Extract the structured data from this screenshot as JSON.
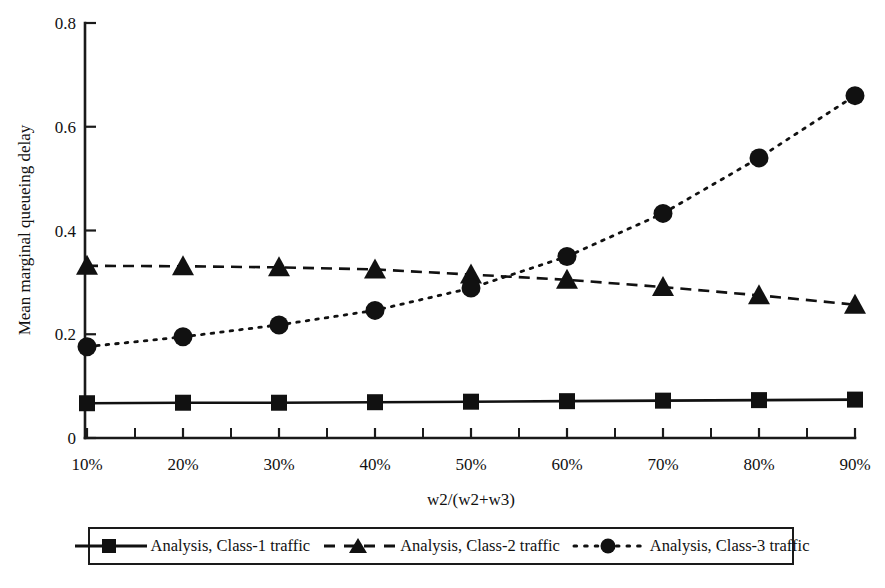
{
  "chart_data": {
    "type": "line",
    "title": "",
    "xlabel": "w2/(w2+w3)",
    "ylabel": "Mean marginal queueing delay",
    "categories": [
      "10%",
      "20%",
      "30%",
      "40%",
      "50%",
      "60%",
      "70%",
      "80%",
      "90%"
    ],
    "x": [
      10,
      20,
      30,
      40,
      50,
      60,
      70,
      80,
      90
    ],
    "xlim": [
      10,
      90
    ],
    "ylim": [
      0,
      0.8
    ],
    "yticks": [
      "0",
      "0.2",
      "0.4",
      "0.6",
      "0.8"
    ],
    "ytick_values": [
      0,
      0.2,
      0.4,
      0.6,
      0.8
    ],
    "grid": false,
    "legend_position": "bottom",
    "series": [
      {
        "name": "Analysis, Class-1 traffic",
        "marker": "square",
        "linestyle": "solid",
        "color": "#111111",
        "values": [
          0.067,
          0.068,
          0.068,
          0.069,
          0.07,
          0.071,
          0.072,
          0.073,
          0.074
        ]
      },
      {
        "name": "Analysis, Class-2 traffic",
        "marker": "triangle",
        "linestyle": "dashed",
        "color": "#111111",
        "values": [
          0.332,
          0.331,
          0.329,
          0.325,
          0.315,
          0.305,
          0.291,
          0.275,
          0.257
        ]
      },
      {
        "name": "Analysis, Class-3 traffic",
        "marker": "circle",
        "linestyle": "dotted",
        "color": "#111111",
        "values": [
          0.176,
          0.195,
          0.218,
          0.246,
          0.289,
          0.35,
          0.433,
          0.54,
          0.66
        ]
      }
    ]
  },
  "legend": {
    "items": [
      {
        "label": "Analysis, Class-1 traffic",
        "marker": "square-marker-icon",
        "linestyle": "solid"
      },
      {
        "label": "Analysis, Class-2 traffic",
        "marker": "triangle-marker-icon",
        "linestyle": "dashed"
      },
      {
        "label": "Analysis, Class-3 traffic",
        "marker": "circle-marker-icon",
        "linestyle": "dotted"
      }
    ]
  },
  "axes": {
    "y_title": "Mean marginal queueing delay",
    "x_title": "w2/(w2+w3)",
    "y_tick_labels": [
      "0.8",
      "0.6",
      "0.4",
      "0.2",
      "0"
    ],
    "x_tick_labels": [
      "10%",
      "20%",
      "30%",
      "40%",
      "50%",
      "60%",
      "70%",
      "80%",
      "90%"
    ]
  },
  "colors": {
    "foreground": "#111111",
    "background": "#ffffff"
  }
}
